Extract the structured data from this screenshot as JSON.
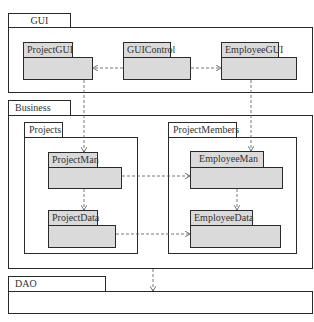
{
  "diagram": {
    "type": "UML package diagram",
    "layers": {
      "gui": {
        "label": "GUI",
        "packages": {
          "project_gui": "ProjectGUI",
          "gui_control": "GUIControl",
          "employee_gui": "EmployeeGUI"
        }
      },
      "business": {
        "label": "Business",
        "projects": {
          "label": "Projects",
          "project_man": "ProjectMan",
          "project_data": "ProjectData"
        },
        "project_members": {
          "label": "ProjectMembers",
          "employee_man": "EmployeeMan",
          "employee_data": "EmployeeData"
        }
      },
      "dao": {
        "label": "DAO"
      }
    },
    "dependencies": [
      {
        "from": "GUIControl",
        "to": "ProjectGUI"
      },
      {
        "from": "GUIControl",
        "to": "EmployeeGUI"
      },
      {
        "from": "ProjectGUI",
        "to": "ProjectMan"
      },
      {
        "from": "EmployeeGUI",
        "to": "EmployeeMan"
      },
      {
        "from": "ProjectMan",
        "to": "ProjectData"
      },
      {
        "from": "ProjectMan",
        "to": "EmployeeMan"
      },
      {
        "from": "EmployeeMan",
        "to": "EmployeeData"
      },
      {
        "from": "ProjectData",
        "to": "EmployeeData"
      },
      {
        "from": "Business",
        "to": "DAO"
      }
    ],
    "colors": {
      "line": "#2a2a2a",
      "package_fill": "#dadada",
      "background": "#ffffff",
      "dependency": "#555555"
    }
  }
}
